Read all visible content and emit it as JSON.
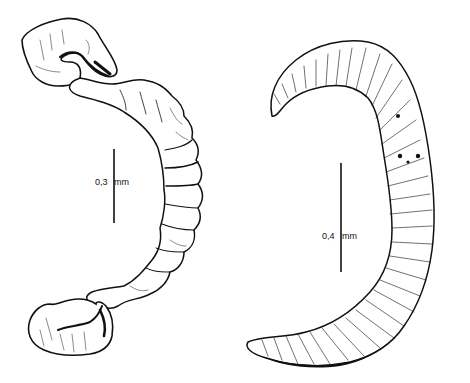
{
  "figure": {
    "type": "scientific-illustration",
    "specimens": [
      {
        "id": "left-specimen",
        "description": "C-shaped segmented organ with curled hooked ends, stippled and wrinkled texture",
        "scale_bar": {
          "value": "0,3",
          "unit": "mm"
        }
      },
      {
        "id": "right-specimen",
        "description": "Crescent-shaped organ with dense radial striations",
        "scale_bar": {
          "value": "0,4",
          "unit": "mm"
        }
      }
    ],
    "colors": {
      "ink": "#111111",
      "background": "#ffffff"
    }
  }
}
